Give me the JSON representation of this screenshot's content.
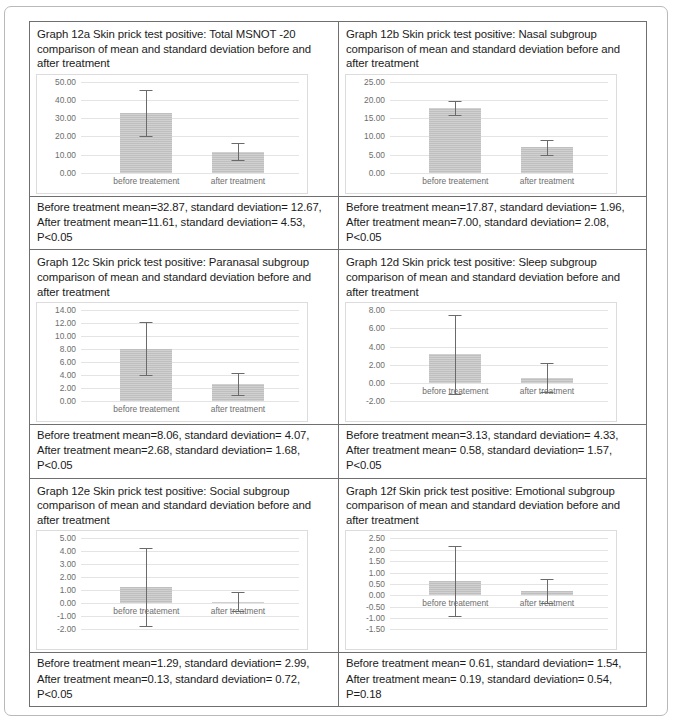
{
  "chart_data": [
    {
      "id": "12a",
      "type": "bar",
      "title": "Graph 12a Skin prick test positive: Total MSNOT -20 comparison of mean and standard deviation before and after treatment",
      "categories": [
        "before treatement",
        "after treatment"
      ],
      "values": [
        32.87,
        11.61
      ],
      "errors": [
        12.67,
        4.53
      ],
      "ylim": [
        0,
        50
      ],
      "yticks": [
        "0.00",
        "10.00",
        "20.00",
        "30.00",
        "40.00",
        "50.00"
      ],
      "ytickvals": [
        0,
        10,
        20,
        30,
        40,
        50
      ],
      "xlabel": "",
      "ylabel": "",
      "grid": true,
      "legend": "none",
      "caption": "Before treatment mean=32.87, standard deviation= 12.67, After treatment mean=11.61, standard deviation= 4.53, P<0.05"
    },
    {
      "id": "12b",
      "type": "bar",
      "title": "Graph 12b Skin prick test positive: Nasal subgroup comparison of mean and standard deviation before and after treatment",
      "categories": [
        "before treatement",
        "after treatment"
      ],
      "values": [
        17.87,
        7.0
      ],
      "errors": [
        1.96,
        2.08
      ],
      "ylim": [
        0,
        25
      ],
      "yticks": [
        "0.00",
        "5.00",
        "10.00",
        "15.00",
        "20.00",
        "25.00"
      ],
      "ytickvals": [
        0,
        5,
        10,
        15,
        20,
        25
      ],
      "xlabel": "",
      "ylabel": "",
      "grid": true,
      "legend": "none",
      "caption": "Before treatment mean=17.87, standard deviation= 1.96, After treatment mean=7.00, standard deviation= 2.08, P<0.05"
    },
    {
      "id": "12c",
      "type": "bar",
      "title": "Graph 12c Skin prick test positive: Paranasal subgroup comparison of mean and standard deviation before and after treatment",
      "categories": [
        "before treatement",
        "after treatment"
      ],
      "values": [
        8.06,
        2.68
      ],
      "errors": [
        4.07,
        1.68
      ],
      "ylim": [
        0,
        14
      ],
      "yticks": [
        "0.00",
        "2.00",
        "4.00",
        "6.00",
        "8.00",
        "10.00",
        "12.00",
        "14.00"
      ],
      "ytickvals": [
        0,
        2,
        4,
        6,
        8,
        10,
        12,
        14
      ],
      "xlabel": "",
      "ylabel": "",
      "grid": true,
      "legend": "none",
      "caption": "Before treatment mean=8.06, standard deviation= 4.07, After treatment mean=2.68, standard deviation= 1.68, P<0.05"
    },
    {
      "id": "12d",
      "type": "bar",
      "title": "Graph 12d Skin prick test positive: Sleep subgroup comparison of mean and standard deviation before and after treatment",
      "categories": [
        "before treatement",
        "after treatment"
      ],
      "values": [
        3.13,
        0.58
      ],
      "errors": [
        4.33,
        1.57
      ],
      "ylim": [
        -2,
        8
      ],
      "yticks": [
        "-2.00",
        "0.00",
        "2.00",
        "4.00",
        "6.00",
        "8.00"
      ],
      "ytickvals": [
        -2,
        0,
        2,
        4,
        6,
        8
      ],
      "xlabel": "",
      "ylabel": "",
      "grid": true,
      "legend": "none",
      "caption": "Before treatment mean=3.13, standard deviation= 4.33, After treatment mean= 0.58, standard deviation= 1.57, P<0.05"
    },
    {
      "id": "12e",
      "type": "bar",
      "title": "Graph 12e Skin prick test positive: Social subgroup comparison of mean and standard deviation before and after treatment",
      "categories": [
        "before treatement",
        "after treatment"
      ],
      "values": [
        1.29,
        0.13
      ],
      "errors": [
        2.99,
        0.72
      ],
      "ylim": [
        -2,
        5
      ],
      "yticks": [
        "-2.00",
        "-1.00",
        "0.00",
        "1.00",
        "2.00",
        "3.00",
        "4.00",
        "5.00"
      ],
      "ytickvals": [
        -2,
        -1,
        0,
        1,
        2,
        3,
        4,
        5
      ],
      "xlabel": "",
      "ylabel": "",
      "grid": true,
      "legend": "none",
      "caption": "Before treatment mean=1.29, standard deviation= 2.99, After treatment mean=0.13, standard deviation= 0.72, P<0.05"
    },
    {
      "id": "12f",
      "type": "bar",
      "title": "Graph 12f Skin prick test positive: Emotional subgroup comparison of mean and standard deviation before and after treatment",
      "categories": [
        "before treatement",
        "after treatment"
      ],
      "values": [
        0.61,
        0.19
      ],
      "errors": [
        1.54,
        0.54
      ],
      "ylim": [
        -1.5,
        2.5
      ],
      "yticks": [
        "-1.50",
        "-1.00",
        "-0.50",
        "0.00",
        "0.50",
        "1.00",
        "1.50",
        "2.00",
        "2.50"
      ],
      "ytickvals": [
        -1.5,
        -1,
        -0.5,
        0,
        0.5,
        1,
        1.5,
        2,
        2.5
      ],
      "xlabel": "",
      "ylabel": "",
      "grid": true,
      "legend": "none",
      "caption": "Before treatment mean= 0.61, standard deviation= 1.54, After treatment mean= 0.19, standard deviation= 0.54, P=0.18"
    }
  ],
  "colors": {
    "bar": "#bfbfbf",
    "whisker": "#6a6a6a",
    "grid": "#e4e4e4",
    "tick_text": "#6d6d6d",
    "table_border": "#6f6f6f",
    "page_border": "#b9b9b9"
  }
}
